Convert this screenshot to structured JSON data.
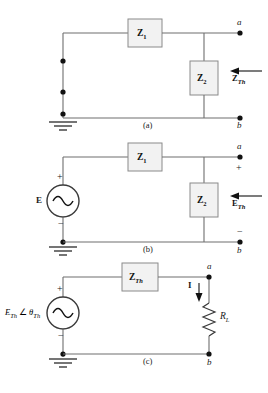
{
  "figure": {
    "background": "#ffffff",
    "line_color": "#6e6e6e",
    "text_color": "#1a1a1a",
    "box_fill": "#f2f2f2"
  },
  "panels": [
    {
      "id": "a",
      "caption": "(a)",
      "components": [
        {
          "name": "impedance-z1",
          "label_main": "Z",
          "label_sub": "1"
        },
        {
          "name": "impedance-z2",
          "label_main": "Z",
          "label_sub": "2"
        }
      ],
      "nodes": [
        {
          "name": "node-a",
          "label": "a"
        },
        {
          "name": "node-b",
          "label": "b"
        }
      ],
      "annotations": [
        {
          "name": "z-thevenin-arrow-label",
          "label_main": "Z",
          "label_sub": "Th"
        }
      ]
    },
    {
      "id": "b",
      "caption": "(b)",
      "components": [
        {
          "name": "impedance-z1",
          "label_main": "Z",
          "label_sub": "1"
        },
        {
          "name": "impedance-z2",
          "label_main": "Z",
          "label_sub": "2"
        },
        {
          "name": "ac-voltage-source",
          "label": "E",
          "plus": "+",
          "minus": "−"
        }
      ],
      "nodes": [
        {
          "name": "node-a",
          "label": "a"
        },
        {
          "name": "node-b",
          "label": "b"
        }
      ],
      "annotations": [
        {
          "name": "e-thevenin-arrow-label",
          "label_main": "E",
          "label_sub": "Th"
        },
        {
          "name": "terminal-plus",
          "label": "+"
        },
        {
          "name": "terminal-minus",
          "label": "−"
        }
      ]
    },
    {
      "id": "c",
      "caption": "(c)",
      "components": [
        {
          "name": "impedance-zth",
          "label_main": "Z",
          "label_sub": "Th"
        },
        {
          "name": "ac-voltage-source",
          "label": "E",
          "plus": "+",
          "minus": "−"
        },
        {
          "name": "load-resistor",
          "label_main": "R",
          "label_sub": "L"
        }
      ],
      "nodes": [
        {
          "name": "node-a",
          "label": "a"
        },
        {
          "name": "node-b",
          "label": "b"
        }
      ],
      "annotations": [
        {
          "name": "source-phasor-label",
          "main": "E",
          "sub": "Th",
          "angle_symbol": "∠",
          "theta": "θ",
          "theta_sub": "Th"
        },
        {
          "name": "current-label",
          "label": "I"
        }
      ]
    }
  ],
  "symbols": {
    "ground": "ground-symbol",
    "ac_source": "ac-sine-source",
    "resistor": "zigzag-resistor",
    "arrow_left": "left-arrow",
    "arrow_down": "down-arrow",
    "junction_dot": "junction-dot"
  }
}
